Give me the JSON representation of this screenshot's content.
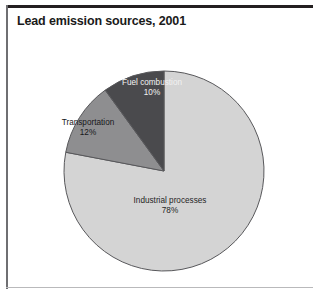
{
  "figure": {
    "title": "Lead emission sources, 2001"
  },
  "chart_data": {
    "type": "pie",
    "title": "Lead emission sources, 2001",
    "xlabel": "",
    "ylabel": "",
    "unit": "percent",
    "total": 100,
    "legend": "none",
    "labels_inside_slices": true,
    "categories": [
      "Industrial processes",
      "Transportation",
      "Fuel combustion"
    ],
    "values": [
      78,
      12,
      10
    ],
    "slices": [
      {
        "label": "Industrial processes",
        "value": 78,
        "value_text": "78%",
        "color": "#d4d4d4",
        "text_color": "#1f1f1f"
      },
      {
        "label": "Transportation",
        "value": 12,
        "value_text": "12%",
        "color": "#8e8e90",
        "text_color": "#17171a"
      },
      {
        "label": "Fuel combustion",
        "value": 10,
        "value_text": "10%",
        "color": "#4a4a4d",
        "text_color": "#f2f2f2"
      }
    ],
    "start_angle_deg": 0,
    "direction": "clockwise",
    "geometry": {
      "center_x": 164,
      "center_y": 171,
      "radius": 100
    },
    "outline_color": "#58585b"
  },
  "frame": {
    "top_rule_color": "#231f20",
    "side_rule_color": "#6f6f72"
  }
}
